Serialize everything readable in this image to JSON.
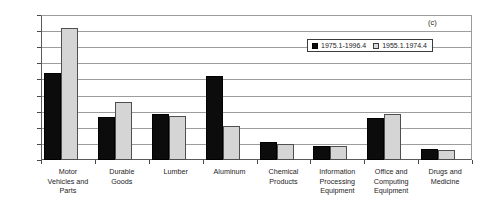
{
  "panel_label": "(c)",
  "legend": {
    "position": "upper-right-inside",
    "entries": [
      {
        "label": "1975.1-1996.4",
        "swatch": "series-a-swatch",
        "color": "#0c0c0c"
      },
      {
        "label": "1955.1.1974.4",
        "swatch": "series-b-swatch",
        "color": "#d5d5d5"
      }
    ]
  },
  "chart_data": {
    "type": "bar",
    "title": "",
    "subtitle": "",
    "xlabel": "",
    "ylabel": "",
    "ylim": [
      0,
      0.9
    ],
    "yticks": [
      "0",
      "0.1",
      "0.2",
      "0.3",
      "0.4",
      "0.5",
      "0.6",
      "0.7",
      "0.8",
      "0.9"
    ],
    "ytick_values": [
      0,
      0.1,
      0.2,
      0.3,
      0.4,
      0.5,
      0.6,
      0.7,
      0.8,
      0.9
    ],
    "grid": "horizontal",
    "legend_position": "upper right (inside axes)",
    "annotations": [
      "(c)"
    ],
    "categories": [
      "Motor Vehicles and Parts",
      "Durable Goods",
      "Lumber",
      "Aluminum",
      "Chemical Products",
      "Information Processing Equipment",
      "Office and Computing Equipment",
      "Drugs and Medicine"
    ],
    "category_lines": [
      [
        "Motor",
        "Vehicles and",
        "Parts"
      ],
      [
        "Durable",
        "Goods"
      ],
      [
        "Lumber"
      ],
      [
        "Aluminum"
      ],
      [
        "Chemical",
        "Products"
      ],
      [
        "Information",
        "Processing",
        "Equipment"
      ],
      [
        "Office and",
        "Computing",
        "Equipment"
      ],
      [
        "Drugs and",
        "Medicine"
      ]
    ],
    "series": [
      {
        "name": "1975.1-1996.4",
        "color": "#0c0c0c",
        "values": [
          0.54,
          0.27,
          0.285,
          0.52,
          0.11,
          0.09,
          0.26,
          0.07
        ]
      },
      {
        "name": "1955.1.1974.4",
        "color": "#d5d5d5",
        "values": [
          0.82,
          0.36,
          0.275,
          0.21,
          0.1,
          0.085,
          0.285,
          0.065
        ]
      }
    ]
  }
}
